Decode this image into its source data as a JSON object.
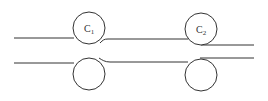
{
  "diagram": {
    "type": "roller-pair diagram",
    "stroke_color": "#333333",
    "rollers": [
      {
        "id": "c1",
        "label_main": "C",
        "label_sub": "1",
        "position": "top-left"
      },
      {
        "id": "c2",
        "label_main": "C",
        "label_sub": "2",
        "position": "top-right"
      },
      {
        "id": "b1",
        "label_main": "",
        "label_sub": "",
        "position": "bottom-left"
      },
      {
        "id": "b2",
        "label_main": "",
        "label_sub": "",
        "position": "bottom-right"
      }
    ]
  }
}
